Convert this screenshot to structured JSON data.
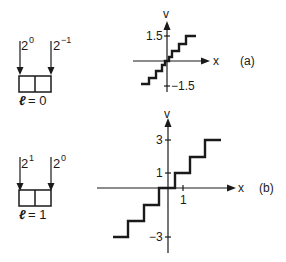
{
  "panels": [
    {
      "id": "a",
      "caption": "(a)",
      "register": {
        "bit_weights": [
          {
            "base": "2",
            "exp": "0"
          },
          {
            "base": "2",
            "exp": "−1"
          }
        ],
        "label_var": "ℓ",
        "label_eq": "= 0"
      },
      "plot": {
        "y_axis_label": "v",
        "x_axis_label": "x",
        "y_ticks": [
          {
            "label": "1.5",
            "value": 1.5
          },
          {
            "label": "−1.5",
            "value": -1.5
          }
        ]
      }
    },
    {
      "id": "b",
      "caption": "(b)",
      "register": {
        "bit_weights": [
          {
            "base": "2",
            "exp": "1"
          },
          {
            "base": "2",
            "exp": "0"
          }
        ],
        "label_var": "ℓ",
        "label_eq": "= 1"
      },
      "plot": {
        "y_axis_label": "v",
        "x_axis_label": "x",
        "y_ticks": [
          {
            "label": "3",
            "value": 3
          },
          {
            "label": "1",
            "value": 1
          },
          {
            "label": "−3",
            "value": -3
          }
        ],
        "x_ticks": [
          {
            "label": "1",
            "value": 1
          }
        ]
      }
    }
  ],
  "colors": {
    "ink": "#1a1a1a",
    "background": "#ffffff"
  }
}
